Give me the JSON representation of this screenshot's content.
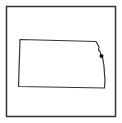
{
  "map": {
    "region": "Kansas",
    "style": "outline",
    "frame_color": "#333333",
    "outline_color": "#333333",
    "marker": {
      "shape": "dot",
      "color": "#111111",
      "location": "northeast-corner"
    }
  }
}
